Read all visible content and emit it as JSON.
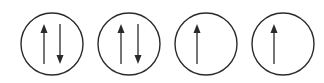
{
  "diagram": {
    "stroke_color": "#2a2a2a",
    "orbitals": [
      {
        "cx": 52,
        "cy": 44,
        "r": 31,
        "arrows": [
          {
            "dir": "up",
            "x": 44
          },
          {
            "dir": "down",
            "x": 60
          }
        ]
      },
      {
        "cx": 129,
        "cy": 44,
        "r": 31,
        "arrows": [
          {
            "dir": "up",
            "x": 121
          },
          {
            "dir": "down",
            "x": 138
          }
        ]
      },
      {
        "cx": 206,
        "cy": 44,
        "r": 31,
        "arrows": [
          {
            "dir": "up",
            "x": 197
          }
        ]
      },
      {
        "cx": 283,
        "cy": 44,
        "r": 31,
        "arrows": [
          {
            "dir": "up",
            "x": 274
          }
        ]
      }
    ]
  }
}
